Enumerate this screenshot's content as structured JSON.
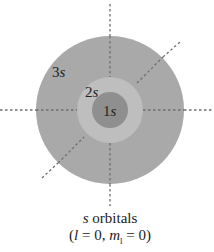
{
  "diagram": {
    "title": "s orbitals",
    "orbitals": [
      {
        "label_num": "3",
        "label_letter": "s",
        "radius": 74,
        "color": "#a9a9a9"
      },
      {
        "label_num": "2",
        "label_letter": "s",
        "radius": 33,
        "color": "#bebebe"
      },
      {
        "label_num": "1",
        "label_letter": "s",
        "radius": 18,
        "color": "#8f8f8f"
      }
    ],
    "axes_color": "#6e6e6e"
  },
  "caption": {
    "line1_italic": "s",
    "line1_rest": " orbitals",
    "line2_open": "(",
    "l_symbol": "l",
    "l_eq": " = 0, ",
    "m_symbol": "m",
    "m_sub": "l",
    "m_eq": " = 0)"
  }
}
